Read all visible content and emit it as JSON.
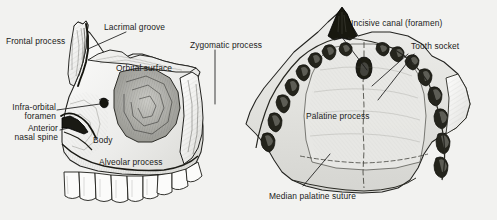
{
  "figure": {
    "background_color": "#f2f2f0",
    "ink_color": "#1a1a1a",
    "panels": [
      {
        "id": "lateral",
        "name": "Lateral view of the maxilla"
      },
      {
        "id": "palatal",
        "name": "Inferior (palatal) view of the maxillae"
      }
    ]
  },
  "labels": {
    "frontal_process": "Frontal process",
    "lacrimal_groove": "Lacrimal groove",
    "orbital_surface": "Orbital surface",
    "infra_orbital_foramen_line1": "Infra-orbital",
    "infra_orbital_foramen_line2": "foramen",
    "anterior_nasal_spine_line1": "Anterior",
    "anterior_nasal_spine_line2": "nasal spine",
    "body": "Body",
    "alveolar_process": "Alveolar process",
    "zygomatic_process": "Zygomatic process",
    "incisive_canal": "Incisive canal (foramen)",
    "tooth_socket": "Tooth socket",
    "palatine_process": "Palatine process",
    "median_palatine_suture": "Median palatine suture"
  }
}
